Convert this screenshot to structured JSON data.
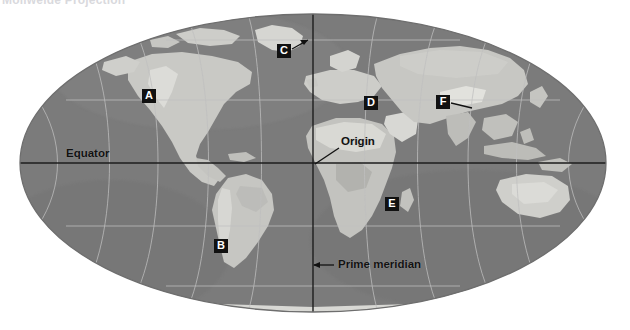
{
  "page": {
    "width": 630,
    "height": 330,
    "background_color": "#ffffff",
    "partial_title": "Mollweide Projection"
  },
  "map": {
    "projection_name": "Mollweide",
    "shape": "ellipse",
    "ocean_color": "#7a7a7a",
    "land_color": "#c8c8c4",
    "graticule_color": "#b9b9b9",
    "axis_line_color": "#1d1d1d",
    "outline_color": "#6f6f6f",
    "center_x": 313,
    "center_y": 163,
    "semi_axis_x": 293,
    "semi_axis_y": 149,
    "graticule": {
      "meridian_interval_degrees": 30,
      "parallel_interval_degrees": 30,
      "grid_visible": true
    }
  },
  "annotations": {
    "letters": [
      {
        "id": "A",
        "label": "A",
        "x": 142,
        "y": 89,
        "region_hint": "North America / western United States",
        "leader": false
      },
      {
        "id": "B",
        "label": "B",
        "x": 214,
        "y": 239,
        "region_hint": "South America / southern cone",
        "leader": false
      },
      {
        "id": "C",
        "label": "C",
        "x": 277,
        "y": 44,
        "region_hint": "Greenland / high northern latitude",
        "leader": true,
        "leader_to_x": 306,
        "leader_to_y": 41
      },
      {
        "id": "D",
        "label": "D",
        "x": 364,
        "y": 96,
        "region_hint": "Eastern Europe / western Asia",
        "leader": false
      },
      {
        "id": "E",
        "label": "E",
        "x": 385,
        "y": 197,
        "region_hint": "Southern Africa",
        "leader": false
      },
      {
        "id": "F",
        "label": "F",
        "x": 436,
        "y": 95,
        "region_hint": "Central / eastern Asia",
        "leader": true,
        "leader_to_x": 470,
        "leader_to_y": 106
      }
    ],
    "equator": {
      "label": "Equator",
      "x": 66,
      "y": 147,
      "line_y": 163
    },
    "origin": {
      "label": "Origin",
      "x": 341,
      "y": 135,
      "leader_from_x": 339,
      "leader_from_y": 148,
      "leader_to_x": 314,
      "leader_to_y": 164
    },
    "prime_meridian": {
      "label": "Prime meridian",
      "x": 338,
      "y": 258,
      "arrow_from_x": 335,
      "arrow_from_y": 265,
      "arrow_to_x": 313,
      "arrow_to_y": 265,
      "line_x": 313
    }
  }
}
